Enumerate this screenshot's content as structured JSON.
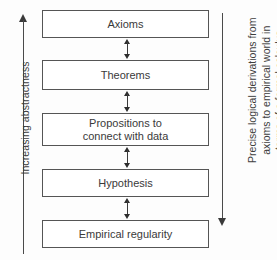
{
  "diagram": {
    "type": "flowchart-vertical",
    "colors": {
      "box_border": "#555555",
      "box_fill": "#ffffff",
      "text": "#3a3a3a",
      "arrow": "#3a3a3a",
      "background": "#fdfdfd"
    },
    "nodes": [
      {
        "id": "axioms",
        "label": "Axioms",
        "level": 1
      },
      {
        "id": "theorems",
        "label": "Theorems",
        "level": 2
      },
      {
        "id": "propositions",
        "label": "Propositions to\nconnect with data",
        "label_line1": "Propositions to",
        "label_line2": "connect with data",
        "level": 3
      },
      {
        "id": "hypothesis",
        "label": "Hypothesis",
        "level": 4
      },
      {
        "id": "empirical",
        "label": "Empirical regularity",
        "level": 5
      }
    ],
    "connectors": [
      {
        "from": "axioms",
        "to": "theorems",
        "style": "double-headed-arrow"
      },
      {
        "from": "theorems",
        "to": "propositions",
        "style": "double-headed-arrow"
      },
      {
        "from": "propositions",
        "to": "hypothesis",
        "style": "double-headed-arrow"
      },
      {
        "from": "hypothesis",
        "to": "empirical",
        "style": "double-headed-arrow"
      }
    ],
    "left_axis": {
      "label": "Increasing abstractness",
      "direction": "up",
      "arrow_icon": "arrow-up-icon"
    },
    "right_axis": {
      "label": "Precise logical derivations from axioms to empirical world in terms of a formal calculus",
      "line1": "Precise logical derivations from",
      "line2": "axioms to empirical world in",
      "line3": "terms of a formal calculus",
      "direction": "down",
      "arrow_icon": "arrow-down-icon"
    }
  }
}
